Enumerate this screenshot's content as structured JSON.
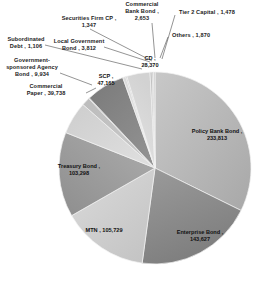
{
  "chart_data": {
    "type": "pie",
    "title": "",
    "subtitle": "",
    "xlabel": "",
    "ylabel": "",
    "legend_position": "none",
    "grid": false,
    "label_format": "name, value",
    "total": 724617,
    "categories": [
      "Policy Bank Bond",
      "Enterprise Bond",
      "MTN",
      "Treasury Bond",
      "SCP",
      "Commercial Paper",
      "CD",
      "Government-sponsored Agency Bond",
      "Local Government Bond",
      "Commercial Bank Bond",
      "Others",
      "Tier 2 Capital",
      "Securities Firm CP",
      "Subordinated Debt"
    ],
    "values": [
      233813,
      143627,
      105729,
      103298,
      47165,
      39738,
      28370,
      9934,
      3812,
      2653,
      1870,
      1478,
      1347,
      1106
    ],
    "slices": [
      {
        "name": "Policy Bank Bond",
        "value": 233813,
        "value_text": "233,813",
        "label": "Policy Bank Bond ,  233,813",
        "color": "#b9b9b9",
        "placement": "inside"
      },
      {
        "name": "Enterprise Bond",
        "value": 143627,
        "value_text": "143,627",
        "label": "Enterprise Bond ,  143,627",
        "color": "#8f8f8f",
        "placement": "inside"
      },
      {
        "name": "MTN",
        "value": 105729,
        "value_text": "105,729",
        "label": "MTN ,  105,729",
        "color": "#cfcfcf",
        "placement": "inside"
      },
      {
        "name": "Treasury Bond",
        "value": 103298,
        "value_text": "103,298",
        "label": "Treasury Bond ,  103,298",
        "color": "#a3a3a3",
        "placement": "inside"
      },
      {
        "name": "Commercial Paper",
        "value": 39738,
        "value_text": "39,738",
        "label": "Commercial Paper ,  39,738",
        "color": "#d8d8d8",
        "placement": "outside"
      },
      {
        "name": "Government-sponsored Agency Bond",
        "value": 9934,
        "value_text": "9,934",
        "label": "Government-sponsored Agency Bond ,  9,934",
        "color": "#c4c4c4",
        "placement": "outside"
      },
      {
        "name": "Subordinated Debt",
        "value": 1106,
        "value_text": "1,106",
        "label": "Subordinated Debt ,  1,106",
        "color": "#b0b0b0",
        "placement": "outside"
      },
      {
        "name": "SCP",
        "value": 47165,
        "value_text": "47,165",
        "label": "SCP ,  47,165",
        "color": "#8b8b8b",
        "placement": "inside"
      },
      {
        "name": "Local Government Bond",
        "value": 3812,
        "value_text": "3,812",
        "label": "Local Government Bond ,  3,812",
        "color": "#e2e2e2",
        "placement": "outside"
      },
      {
        "name": "Securities Firm CP",
        "value": 1347,
        "value_text": "1,347",
        "label": "Securities Firm CP ,  1,347",
        "color": "#bdbdbd",
        "placement": "outside"
      },
      {
        "name": "CD",
        "value": 28370,
        "value_text": "28,370",
        "label": "CD ,  28,370",
        "color": "#dddddd",
        "placement": "inside"
      },
      {
        "name": "Commercial Bank Bond",
        "value": 2653,
        "value_text": "2,653",
        "label": "Commercial Bank Bond ,  2,653",
        "color": "#c9c9c9",
        "placement": "outside"
      },
      {
        "name": "Tier 2 Capital",
        "value": 1478,
        "value_text": "1,478",
        "label": "Tier 2 Capital ,  1,478",
        "color": "#aaaaaa",
        "placement": "outside"
      },
      {
        "name": "Others",
        "value": 1870,
        "value_text": "1,870",
        "label": "Others ,  1,870",
        "color": "#d2d2d2",
        "placement": "outside"
      }
    ]
  },
  "labels": {
    "securities_firm_cp_name": "Securities Firm CP ,",
    "securities_firm_cp_value": "1,347",
    "commercial_bank_bond_l1": "Commercial",
    "commercial_bank_bond_l2": "Bank Bond ,",
    "commercial_bank_bond_l3": "2,653",
    "tier2_capital": "Tier 2 Capital ,  1,478",
    "others": "Others ,  1,870",
    "local_government_bond_l1": "Local Government",
    "local_government_bond_l2": "Bond ,  3,812",
    "subordinated_debt_l1": "Subordinated",
    "subordinated_debt_l2": "Debt ,  1,106",
    "gov_agency_l1": "Government-",
    "gov_agency_l2": "sponsored Agency",
    "gov_agency_l3": "Bond ,  9,934",
    "commercial_paper_l1": "Commercial",
    "commercial_paper_l2": "Paper ,  39,738",
    "cd_l1": "CD ,",
    "cd_l2": "28,370",
    "scp_l1": "SCP ,",
    "scp_l2": "47,165",
    "policy_bank_bond_l1": "Policy Bank Bond ,",
    "policy_bank_bond_l2": "233,813",
    "enterprise_bond_l1": "Enterprise Bond ,",
    "enterprise_bond_l2": "143,627",
    "mtn": "MTN ,  105,729",
    "treasury_bond_l1": "Treasury Bond ,",
    "treasury_bond_l2": "103,298"
  },
  "colors": {
    "background": "#ffffff",
    "text": "#1c1c1c",
    "leader_line": "#333333",
    "slice_edge": "#f2f2f2"
  }
}
